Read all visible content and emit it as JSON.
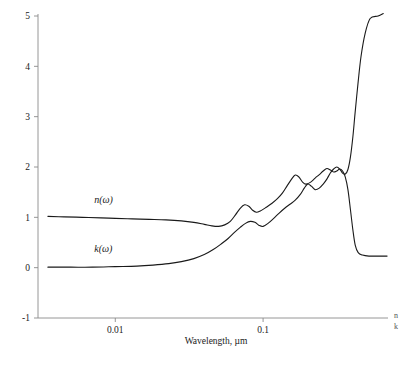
{
  "chart_data": {
    "type": "line",
    "title": "",
    "xlabel": "Wavelength, µm",
    "ylabel": "",
    "xscale": "log",
    "xlim": [
      0.003,
      0.7
    ],
    "ylim": [
      -1,
      5
    ],
    "xticks": [
      0.01,
      0.1
    ],
    "xtick_labels": [
      "0.01",
      "0.1"
    ],
    "yticks": [
      -1,
      0,
      1,
      2,
      3,
      4,
      5
    ],
    "ytick_labels": [
      "-1",
      "0",
      "1",
      "2",
      "3",
      "4",
      "5"
    ],
    "grid": false,
    "legend_position": "inline-annotations",
    "series": [
      {
        "name": "n(ω)",
        "label": "n(ω)",
        "color": "#1a1a1a",
        "annotation_x": 0.0072,
        "annotation_y": 1.28,
        "points": [
          [
            0.0035,
            1.02
          ],
          [
            0.0045,
            1.01
          ],
          [
            0.006,
            1.0
          ],
          [
            0.008,
            0.99
          ],
          [
            0.01,
            0.98
          ],
          [
            0.013,
            0.97
          ],
          [
            0.017,
            0.96
          ],
          [
            0.022,
            0.95
          ],
          [
            0.028,
            0.93
          ],
          [
            0.034,
            0.9
          ],
          [
            0.04,
            0.86
          ],
          [
            0.045,
            0.83
          ],
          [
            0.05,
            0.82
          ],
          [
            0.055,
            0.85
          ],
          [
            0.06,
            0.92
          ],
          [
            0.065,
            1.05
          ],
          [
            0.07,
            1.18
          ],
          [
            0.075,
            1.25
          ],
          [
            0.08,
            1.22
          ],
          [
            0.085,
            1.14
          ],
          [
            0.09,
            1.1
          ],
          [
            0.095,
            1.12
          ],
          [
            0.105,
            1.2
          ],
          [
            0.115,
            1.28
          ],
          [
            0.125,
            1.37
          ],
          [
            0.135,
            1.48
          ],
          [
            0.145,
            1.62
          ],
          [
            0.155,
            1.75
          ],
          [
            0.165,
            1.84
          ],
          [
            0.175,
            1.8
          ],
          [
            0.185,
            1.7
          ],
          [
            0.195,
            1.66
          ],
          [
            0.21,
            1.7
          ],
          [
            0.225,
            1.78
          ],
          [
            0.24,
            1.85
          ],
          [
            0.255,
            1.92
          ],
          [
            0.27,
            1.97
          ],
          [
            0.285,
            1.94
          ],
          [
            0.3,
            1.9
          ],
          [
            0.315,
            1.92
          ],
          [
            0.33,
            1.96
          ],
          [
            0.345,
            1.92
          ],
          [
            0.36,
            1.8
          ],
          [
            0.375,
            1.55
          ],
          [
            0.39,
            1.15
          ],
          [
            0.405,
            0.75
          ],
          [
            0.42,
            0.45
          ],
          [
            0.44,
            0.3
          ],
          [
            0.47,
            0.25
          ],
          [
            0.52,
            0.23
          ],
          [
            0.6,
            0.23
          ],
          [
            0.69,
            0.23
          ]
        ]
      },
      {
        "name": "k(ω)",
        "label": "k(ω)",
        "color": "#1a1a1a",
        "annotation_x": 0.0072,
        "annotation_y": 0.32,
        "points": [
          [
            0.0035,
            0.01
          ],
          [
            0.005,
            0.01
          ],
          [
            0.007,
            0.01
          ],
          [
            0.01,
            0.02
          ],
          [
            0.014,
            0.03
          ],
          [
            0.018,
            0.05
          ],
          [
            0.023,
            0.08
          ],
          [
            0.028,
            0.12
          ],
          [
            0.034,
            0.18
          ],
          [
            0.04,
            0.26
          ],
          [
            0.046,
            0.36
          ],
          [
            0.052,
            0.47
          ],
          [
            0.058,
            0.58
          ],
          [
            0.064,
            0.7
          ],
          [
            0.07,
            0.8
          ],
          [
            0.076,
            0.88
          ],
          [
            0.082,
            0.92
          ],
          [
            0.088,
            0.9
          ],
          [
            0.094,
            0.84
          ],
          [
            0.1,
            0.82
          ],
          [
            0.108,
            0.88
          ],
          [
            0.118,
            0.98
          ],
          [
            0.128,
            1.08
          ],
          [
            0.14,
            1.18
          ],
          [
            0.152,
            1.26
          ],
          [
            0.165,
            1.34
          ],
          [
            0.178,
            1.45
          ],
          [
            0.19,
            1.58
          ],
          [
            0.2,
            1.66
          ],
          [
            0.212,
            1.62
          ],
          [
            0.225,
            1.55
          ],
          [
            0.24,
            1.58
          ],
          [
            0.255,
            1.66
          ],
          [
            0.27,
            1.76
          ],
          [
            0.285,
            1.88
          ],
          [
            0.3,
            1.96
          ],
          [
            0.315,
            2.0
          ],
          [
            0.33,
            1.96
          ],
          [
            0.345,
            1.88
          ],
          [
            0.36,
            1.86
          ],
          [
            0.375,
            1.95
          ],
          [
            0.39,
            2.2
          ],
          [
            0.405,
            2.6
          ],
          [
            0.42,
            3.1
          ],
          [
            0.44,
            3.7
          ],
          [
            0.46,
            4.2
          ],
          [
            0.49,
            4.65
          ],
          [
            0.53,
            4.95
          ],
          [
            0.6,
            5.0
          ],
          [
            0.65,
            5.05
          ]
        ]
      }
    ],
    "edge_marks": [
      "n",
      "k"
    ]
  }
}
